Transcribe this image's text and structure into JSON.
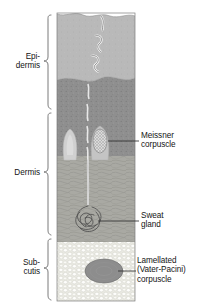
{
  "figure": {
    "title_strip": "",
    "panel": {
      "x": 57,
      "y": 13,
      "width": 78,
      "height": 288,
      "layers": [
        {
          "key": "stratum-corneum",
          "name": "stratum corneum",
          "color": "#b9b9b9",
          "y_top": 13,
          "y_bottom": 83
        },
        {
          "key": "epidermis-deep",
          "name": "deep epidermis",
          "color": "#8f8f8f",
          "y_top": 83,
          "y_bottom": 158
        },
        {
          "key": "dermis",
          "name": "dermis",
          "color": "#a9a9a3",
          "y_top": 158,
          "y_bottom": 243
        },
        {
          "key": "subcutis",
          "name": "subcutis",
          "color": "#efefe9",
          "y_top": 243,
          "y_bottom": 301
        }
      ]
    },
    "brace_labels": [
      {
        "key": "epidermis",
        "text": "Epi-\ndermis",
        "y_top": 14,
        "y_bottom": 110
      },
      {
        "key": "dermis",
        "text": "Dermis",
        "y_top": 110,
        "y_bottom": 236
      },
      {
        "key": "subcutis",
        "text": "Sub-\ncutis",
        "y_top": 236,
        "y_bottom": 301
      }
    ],
    "callouts": [
      {
        "key": "meissner-corpuscle",
        "lines": [
          "Meissner",
          "corpuscle"
        ],
        "leader_from_x": 112,
        "leader_to_x": 139,
        "leader_y": 141,
        "text_x": 141,
        "text_y": 132
      },
      {
        "key": "sweat-gland",
        "lines": [
          "Sweat",
          "gland"
        ],
        "leader_from_x": 105,
        "leader_to_x": 139,
        "leader_y": 221,
        "text_x": 141,
        "text_y": 212
      },
      {
        "key": "lamellated-corpuscle",
        "lines": [
          "Lamellated",
          "(Vater-Pacini)",
          "corpuscle"
        ],
        "leader_from_x": 120,
        "leader_to_x": 136,
        "leader_y": 271,
        "text_x": 137,
        "text_y": 257
      }
    ],
    "structures": [
      {
        "key": "sweat-duct",
        "name": "sweat duct channel",
        "color": "#f2f2f2"
      },
      {
        "key": "dermal-papilla-pale",
        "name": "dermal papilla",
        "color": "#d5d5d5"
      },
      {
        "key": "meissner-body",
        "name": "Meissner corpuscle body",
        "color": "#d9d9d9"
      },
      {
        "key": "sweat-gland-coil",
        "name": "coiled sweat gland",
        "color": "#5a5a5a"
      },
      {
        "key": "pacini-body",
        "name": "Vater-Pacini corpuscle",
        "color": "#8d8d8d"
      },
      {
        "key": "fat-cells",
        "name": "adipocytes",
        "color": "#ffffff"
      }
    ],
    "colors": {
      "ink": "#141414",
      "leader": "#3a3a3a",
      "brace": "#6b6b6b",
      "background": "#ffffff"
    }
  }
}
